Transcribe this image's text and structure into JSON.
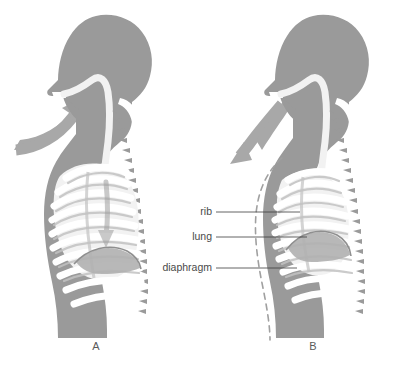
{
  "figure": {
    "background_color": "#ffffff",
    "width": 399,
    "height": 373
  },
  "colors": {
    "body_silhouette": "#9a9a9a",
    "bone_white": "#ffffff",
    "lung_fill": "#f0f0f0",
    "rib_shadow": "#c9c9c9",
    "diaphragm": "#b5b5b5",
    "airflow_arrow": "#a8a8a8",
    "dashed_outline": "#a0a0a0",
    "leader_line": "#3d3d3d",
    "label_text": "#4a4a4a"
  },
  "panels": [
    {
      "id": "panel-a",
      "letter": "A",
      "letter_x": 96,
      "letter_y": 350,
      "state": "inhalation",
      "airflow_direction": "in",
      "chest_state": "expanded",
      "has_dashed_outline": false,
      "has_internal_arrow": true,
      "internal_arrow_direction": "down"
    },
    {
      "id": "panel-b",
      "letter": "B",
      "letter_x": 313,
      "letter_y": 350,
      "state": "exhalation",
      "airflow_direction": "out",
      "chest_state": "contracted",
      "has_dashed_outline": true,
      "has_internal_arrow": false,
      "internal_arrow_direction": ""
    }
  ],
  "callouts": [
    {
      "id": "callout-rib",
      "label": "rib",
      "label_x": 212,
      "label_y": 215,
      "line_x1": 216,
      "line_y1": 212,
      "line_x2": 300,
      "line_y2": 212
    },
    {
      "id": "callout-lung",
      "label": "lung",
      "label_x": 212,
      "label_y": 240,
      "line_x1": 216,
      "line_y1": 237,
      "line_x2": 307,
      "line_y2": 237
    },
    {
      "id": "callout-diaphragm",
      "label": "diaphragm",
      "label_x": 212,
      "label_y": 271,
      "line_x1": 216,
      "line_y1": 268,
      "line_x2": 297,
      "line_y2": 268
    }
  ]
}
